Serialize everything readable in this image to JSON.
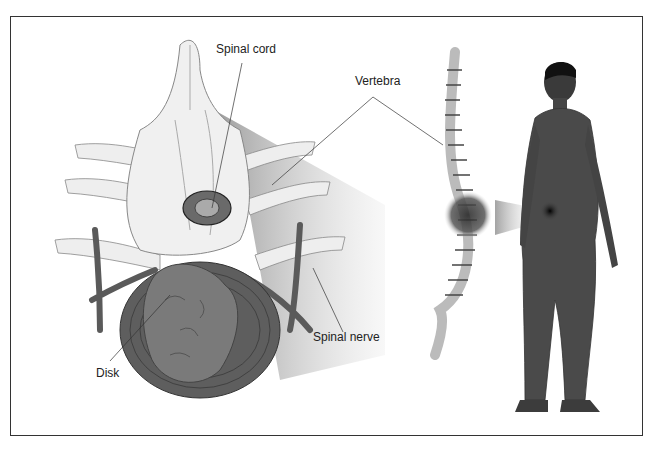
{
  "diagram": {
    "type": "anatomical-illustration",
    "labels": {
      "spinal_cord": "Spinal cord",
      "vertebra": "Vertebra",
      "spinal_nerve": "Spinal nerve",
      "disk": "Disk"
    },
    "panels": [
      {
        "name": "vertebra-closeup",
        "description": "Enlarged cross-section of lumbar vertebrae with disk and spinal nerves"
      },
      {
        "name": "spine-column",
        "description": "Side view of spinal column with highlighted lumbar region"
      },
      {
        "name": "human-figure",
        "description": "Rear three-quarter view of man with pain spot on lower back"
      }
    ],
    "colors": {
      "bone": "#e8e8e8",
      "disk_tissue": "#707070",
      "nerve": "#5a5a5a",
      "figure": "#4a4a4a",
      "pain_spot": "#1a1a1a",
      "frame": "#333333"
    }
  }
}
